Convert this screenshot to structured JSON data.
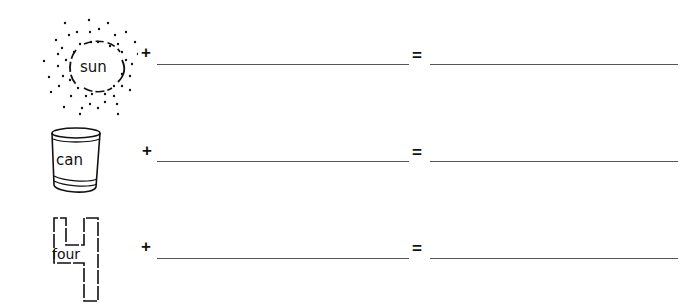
{
  "worksheet": {
    "rows": [
      {
        "picture": "sun-icon",
        "word": "sun",
        "plus": "+",
        "equals": "=",
        "answer1": "",
        "answer2": ""
      },
      {
        "picture": "can-icon",
        "word": "can",
        "plus": "+",
        "equals": "=",
        "answer1": "",
        "answer2": ""
      },
      {
        "picture": "four-icon",
        "word": "four",
        "plus": "+",
        "equals": "=",
        "answer1": "",
        "answer2": ""
      }
    ]
  },
  "colors": {
    "ink": "#111111",
    "line": "#555555",
    "background": "#ffffff"
  }
}
